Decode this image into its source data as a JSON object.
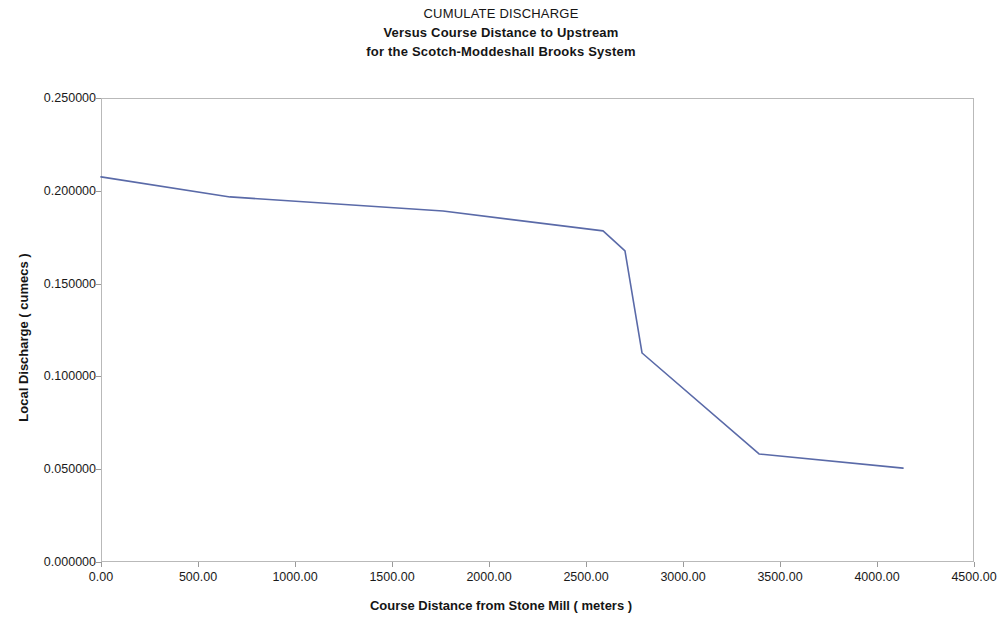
{
  "chart_data": {
    "type": "line",
    "title": "CUMULATE DISCHARGE",
    "subtitle_line2": "Versus Course Distance to Upstream",
    "subtitle_line3": "for the Scotch-Moddeshall Brooks System",
    "xlabel": "Course Distance from Stone Mill ( meters )",
    "ylabel": "Local Discharge ( cumecs )",
    "xlim": [
      0,
      4500
    ],
    "ylim": [
      0,
      0.25
    ],
    "grid": false,
    "legend": null,
    "line_color": "#5a6aa8",
    "xticks": [
      0,
      500,
      1000,
      1500,
      2000,
      2500,
      3000,
      3500,
      4000,
      4500
    ],
    "xtick_labels": [
      "0.00",
      "500.00",
      "1000.00",
      "1500.00",
      "2000.00",
      "2500.00",
      "3000.00",
      "3500.00",
      "4000.00",
      "4500.00"
    ],
    "yticks": [
      0,
      0.05,
      0.1,
      0.15,
      0.2,
      0.25
    ],
    "ytick_labels": [
      "0.000000",
      "0.050000",
      "0.100000",
      "0.150000",
      "0.200000",
      "0.250000"
    ],
    "series": [
      {
        "name": "Local Discharge",
        "x": [
          0,
          665,
          1763,
          2588,
          2701,
          2789,
          3392,
          4134
        ],
        "values": [
          0.2075,
          0.1967,
          0.1891,
          0.1784,
          0.1676,
          0.1126,
          0.0582,
          0.0506
        ]
      }
    ]
  }
}
